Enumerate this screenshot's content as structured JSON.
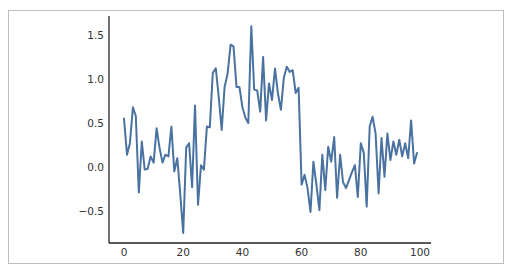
{
  "chart_data": {
    "type": "line",
    "title": "",
    "xlabel": "",
    "ylabel": "",
    "xlim": [
      -5,
      104
    ],
    "ylim": [
      -0.83,
      1.72
    ],
    "grid": false,
    "legend": null,
    "x_ticks": [
      0,
      20,
      40,
      60,
      80,
      100
    ],
    "x_tick_labels": [
      "0",
      "20",
      "40",
      "60",
      "80",
      "100"
    ],
    "y_ticks": [
      -0.5,
      0.0,
      0.5,
      1.0,
      1.5
    ],
    "y_tick_labels": [
      "−0.5",
      "0.0",
      "0.5",
      "1.0",
      "1.5"
    ],
    "series": [
      {
        "name": "series",
        "color": "#4a72a0",
        "x_start": 0,
        "x_step": 1,
        "values": [
          0.55,
          0.14,
          0.27,
          0.68,
          0.58,
          -0.29,
          0.29,
          -0.03,
          -0.02,
          0.12,
          0.05,
          0.44,
          0.22,
          0.05,
          0.14,
          0.12,
          0.46,
          -0.05,
          0.1,
          -0.3,
          -0.75,
          0.22,
          0.27,
          -0.23,
          0.7,
          -0.43,
          0.02,
          -0.03,
          0.46,
          0.45,
          1.07,
          1.12,
          0.8,
          0.42,
          0.91,
          1.06,
          1.39,
          1.37,
          0.91,
          0.91,
          0.68,
          0.56,
          0.5,
          1.6,
          0.88,
          0.87,
          0.63,
          1.25,
          0.53,
          0.95,
          0.76,
          1.12,
          0.84,
          0.65,
          1.01,
          1.14,
          1.08,
          1.1,
          0.84,
          0.9,
          -0.2,
          -0.09,
          -0.24,
          -0.51,
          0.06,
          -0.2,
          -0.49,
          0.14,
          -0.26,
          0.23,
          0.06,
          0.34,
          -0.35,
          0.14,
          -0.17,
          -0.24,
          -0.15,
          -0.06,
          0.02,
          -0.34,
          0.27,
          0.16,
          -0.45,
          0.46,
          0.57,
          0.38,
          -0.3,
          0.33,
          -0.11,
          0.38,
          0.08,
          0.29,
          0.14,
          0.31,
          0.12,
          0.27,
          0.1,
          0.53,
          0.04,
          0.16
        ]
      }
    ]
  },
  "style": {
    "line_color": "#4a72a0",
    "spine_color": "#222222",
    "frame_border_color": "#bdbdbd"
  }
}
